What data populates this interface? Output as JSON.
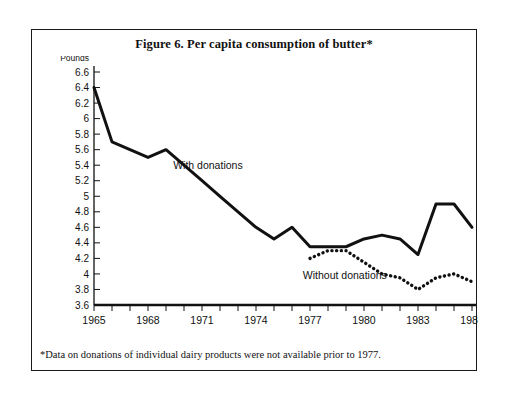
{
  "figure": {
    "title": "Figure 6.  Per capita consumption of butter*",
    "footnote": "*Data on donations of individual dairy products were not available prior to 1977."
  },
  "chart_data": {
    "type": "line",
    "title": "Figure 6.  Per capita consumption of butter*",
    "xlabel": "",
    "ylabel": "Pounds",
    "ylim": [
      3.6,
      6.6
    ],
    "xlim": [
      1965,
      1986
    ],
    "ytick_step": 0.2,
    "grid": false,
    "legend_position": "inline-annotation",
    "yticks": [
      "6.6",
      "6.4",
      "6.2",
      "6",
      "5.8",
      "5.6",
      "5.4",
      "5.2",
      "5",
      "4.8",
      "4.6",
      "4.4",
      "4.2",
      "4",
      "3.8",
      "3.6"
    ],
    "xticks_all": [
      1965,
      1966,
      1967,
      1968,
      1969,
      1970,
      1971,
      1972,
      1973,
      1974,
      1975,
      1976,
      1977,
      1978,
      1979,
      1980,
      1981,
      1982,
      1983,
      1984,
      1985,
      1986
    ],
    "xticks_labeled": [
      "1965",
      "1968",
      "1971",
      "1974",
      "1977",
      "1980",
      "1983",
      "1986"
    ],
    "series": [
      {
        "name": "With donations",
        "style": "solid",
        "color": "#111111",
        "x": [
          1965,
          1966,
          1967,
          1968,
          1969,
          1970,
          1971,
          1972,
          1973,
          1974,
          1975,
          1976,
          1977,
          1978,
          1979,
          1980,
          1981,
          1982,
          1983,
          1984,
          1985,
          1986
        ],
        "values": [
          6.4,
          5.7,
          5.6,
          5.5,
          5.6,
          5.4,
          5.2,
          5.0,
          4.8,
          4.6,
          4.45,
          4.6,
          4.35,
          4.35,
          4.35,
          4.45,
          4.5,
          4.45,
          4.25,
          4.9,
          4.9,
          4.6
        ]
      },
      {
        "name": "Without donations",
        "style": "dotted",
        "color": "#111111",
        "x": [
          1977,
          1978,
          1979,
          1980,
          1981,
          1982,
          1983,
          1984,
          1985,
          1986
        ],
        "values": [
          4.2,
          4.3,
          4.3,
          4.15,
          4.0,
          3.95,
          3.8,
          3.95,
          4.0,
          3.9
        ]
      }
    ],
    "annotations": [
      {
        "text": "With donations",
        "x": 1969.4,
        "y": 5.35
      },
      {
        "text": "Without donations",
        "x": 1976.6,
        "y": 3.93
      }
    ]
  }
}
